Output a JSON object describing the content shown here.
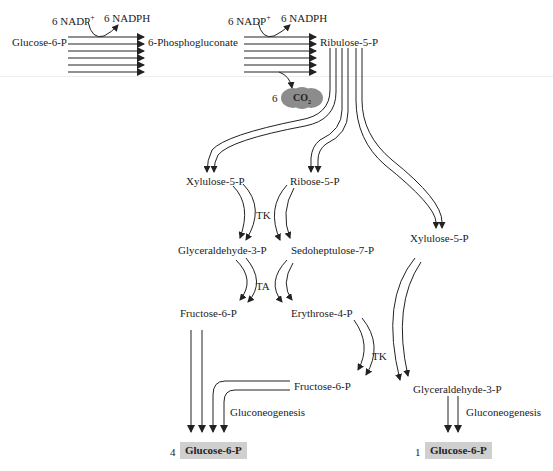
{
  "diagram": {
    "cofactors": {
      "step1": {
        "in": "6 NADP",
        "in_sup": "+",
        "out": "6 NADPH"
      },
      "step2": {
        "in": "6 NADP",
        "in_sup": "+",
        "out": "6 NADPH"
      }
    },
    "co2": {
      "coefficient": "6",
      "label": "CO",
      "subscript": "2",
      "color": "#8c8c8c"
    },
    "metabolites": {
      "glucose6p_start": "Glucose-6-P",
      "phosphogluconate": "6-Phosphogluconate",
      "ribulose5p": "Ribulose-5-P",
      "xylulose5p_left": "Xylulose-5-P",
      "ribose5p": "Ribose-5-P",
      "xylulose5p_right": "Xylulose-5-P",
      "glyceraldehyde3p_left": "Glyceraldehyde-3-P",
      "sedoheptulose7p": "Sedoheptulose-7-P",
      "fructose6p_left": "Fructose-6-P",
      "erythrose4p": "Erythrose-4-P",
      "fructose6p_right": "Fructose-6-P",
      "glyceraldehyde3p_right": "Glyceraldehyde-3-P"
    },
    "enzymes": {
      "tk1": "TK",
      "ta": "TA",
      "tk2": "TK"
    },
    "processes": {
      "gluconeogenesis_left": "Gluconeogenesis",
      "gluconeogenesis_right": "Gluconeogenesis"
    },
    "products": {
      "left": {
        "coefficient": "4",
        "label": "Glucose-6-P"
      },
      "right": {
        "coefficient": "1",
        "label": "Glucose-6-P"
      }
    },
    "colors": {
      "line": "#222222",
      "product_box": "#cfcfcf",
      "co2_blob": "#8c8c8c"
    }
  }
}
